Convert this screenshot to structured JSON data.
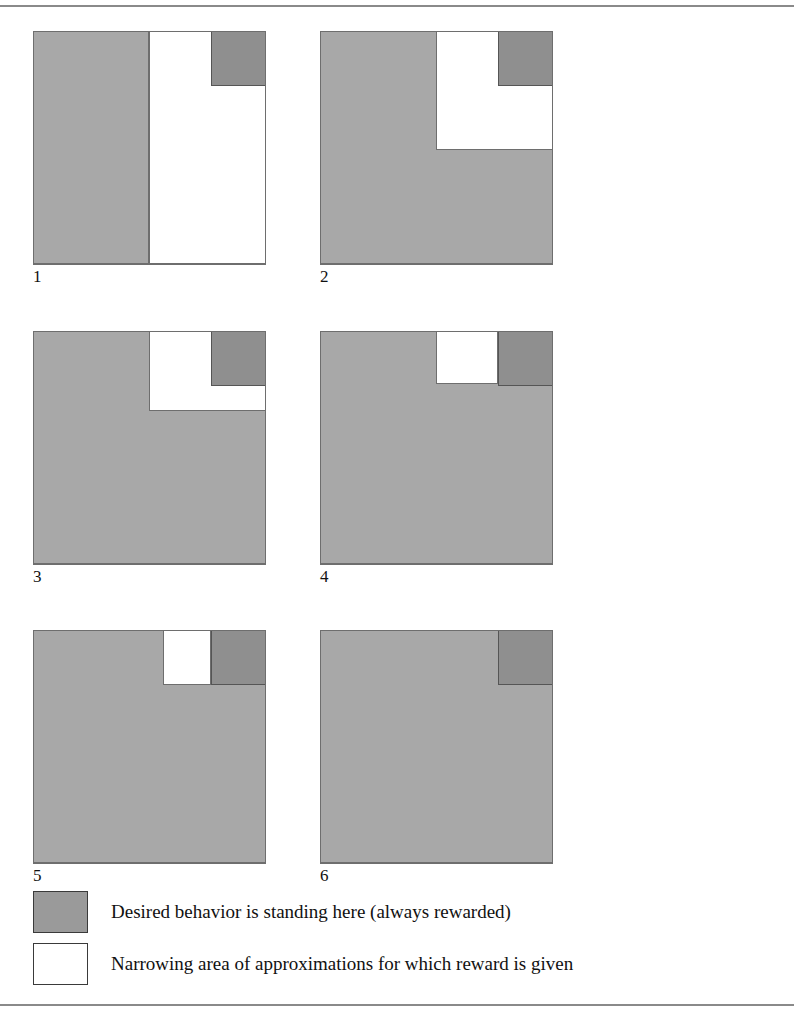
{
  "figure": {
    "type": "diagram",
    "colors": {
      "gray_fill": "#a8a8a8",
      "dark_fill": "#8f8f8f",
      "white_fill": "#ffffff",
      "outline": "#6e6e6e",
      "rule": "#8a8a8a",
      "text": "#111111"
    },
    "rules": {
      "top_label": "top-horizontal-rule",
      "bottom_label": "bottom-horizontal-rule"
    },
    "panels": [
      {
        "label": "1",
        "regions": [
          {
            "kind": "gray",
            "name": "unrewarded-area",
            "x": 0,
            "y": 0,
            "w": 116,
            "h": 233
          },
          {
            "kind": "white",
            "name": "approximation-area",
            "x": 116,
            "y": 0,
            "w": 117,
            "h": 233
          },
          {
            "kind": "dark",
            "name": "desired-behavior-area",
            "x": 178,
            "y": 0,
            "w": 55,
            "h": 55
          }
        ]
      },
      {
        "label": "2",
        "regions": [
          {
            "kind": "gray",
            "name": "unrewarded-area",
            "x": 0,
            "y": 0,
            "w": 233,
            "h": 233
          },
          {
            "kind": "white",
            "name": "approximation-area",
            "x": 116,
            "y": 0,
            "w": 117,
            "h": 119
          },
          {
            "kind": "dark",
            "name": "desired-behavior-area",
            "x": 178,
            "y": 0,
            "w": 55,
            "h": 55
          }
        ]
      },
      {
        "label": "3",
        "regions": [
          {
            "kind": "gray",
            "name": "unrewarded-area",
            "x": 0,
            "y": 0,
            "w": 233,
            "h": 233
          },
          {
            "kind": "white",
            "name": "approximation-area",
            "x": 116,
            "y": 0,
            "w": 117,
            "h": 80
          },
          {
            "kind": "dark",
            "name": "desired-behavior-area",
            "x": 178,
            "y": 0,
            "w": 55,
            "h": 55
          }
        ]
      },
      {
        "label": "4",
        "regions": [
          {
            "kind": "gray",
            "name": "unrewarded-area",
            "x": 0,
            "y": 0,
            "w": 233,
            "h": 233
          },
          {
            "kind": "white",
            "name": "approximation-area",
            "x": 116,
            "y": 0,
            "w": 62,
            "h": 53
          },
          {
            "kind": "dark",
            "name": "desired-behavior-area",
            "x": 178,
            "y": 0,
            "w": 55,
            "h": 55
          }
        ]
      },
      {
        "label": "5",
        "regions": [
          {
            "kind": "gray",
            "name": "unrewarded-area",
            "x": 0,
            "y": 0,
            "w": 233,
            "h": 233
          },
          {
            "kind": "white",
            "name": "approximation-area",
            "x": 130,
            "y": 0,
            "w": 48,
            "h": 55
          },
          {
            "kind": "dark",
            "name": "desired-behavior-area",
            "x": 178,
            "y": 0,
            "w": 55,
            "h": 55
          }
        ]
      },
      {
        "label": "6",
        "regions": [
          {
            "kind": "gray",
            "name": "unrewarded-area",
            "x": 0,
            "y": 0,
            "w": 233,
            "h": 233
          },
          {
            "kind": "dark",
            "name": "desired-behavior-area",
            "x": 178,
            "y": 0,
            "w": 55,
            "h": 55
          }
        ]
      }
    ],
    "legend": [
      {
        "swatch": "dark",
        "text": "Desired behavior is standing here (always rewarded)"
      },
      {
        "swatch": "white",
        "text": "Narrowing area of approximations for which reward is given"
      }
    ]
  }
}
